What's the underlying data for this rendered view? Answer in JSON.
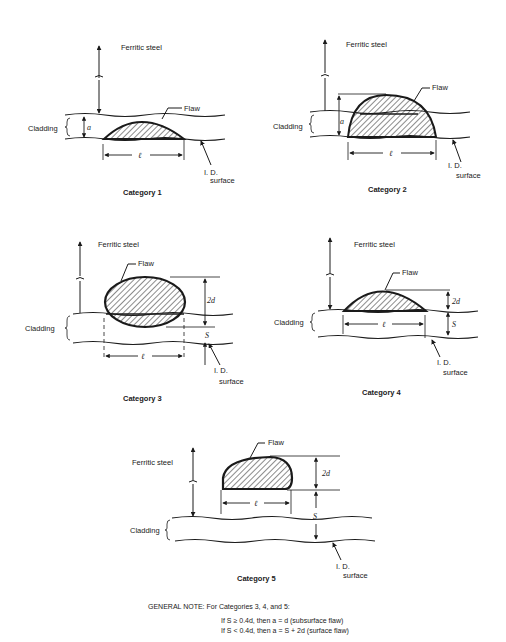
{
  "labels": {
    "ferritic": "Ferritic steel",
    "cladding": "Cladding",
    "flaw": "Flaw",
    "id_line1": "I. D.",
    "id_line2": "surface",
    "a": "a",
    "l": "ℓ",
    "two_d": "2d",
    "s": "S"
  },
  "categories": [
    {
      "caption": "Category 1"
    },
    {
      "caption": "Category 2"
    },
    {
      "caption": "Category 3"
    },
    {
      "caption": "Category 4"
    },
    {
      "caption": "Category 5"
    }
  ],
  "note": {
    "heading": "GENERAL NOTE: For Categories 3, 4, and 5:",
    "line1": "If S ≥ 0.4d, then a = d (subsurface flaw)",
    "line2": "If S < 0.4d, then a = S + 2d (surface flaw)"
  },
  "colors": {
    "ink": "#1a1a1a",
    "background": "#ffffff"
  }
}
